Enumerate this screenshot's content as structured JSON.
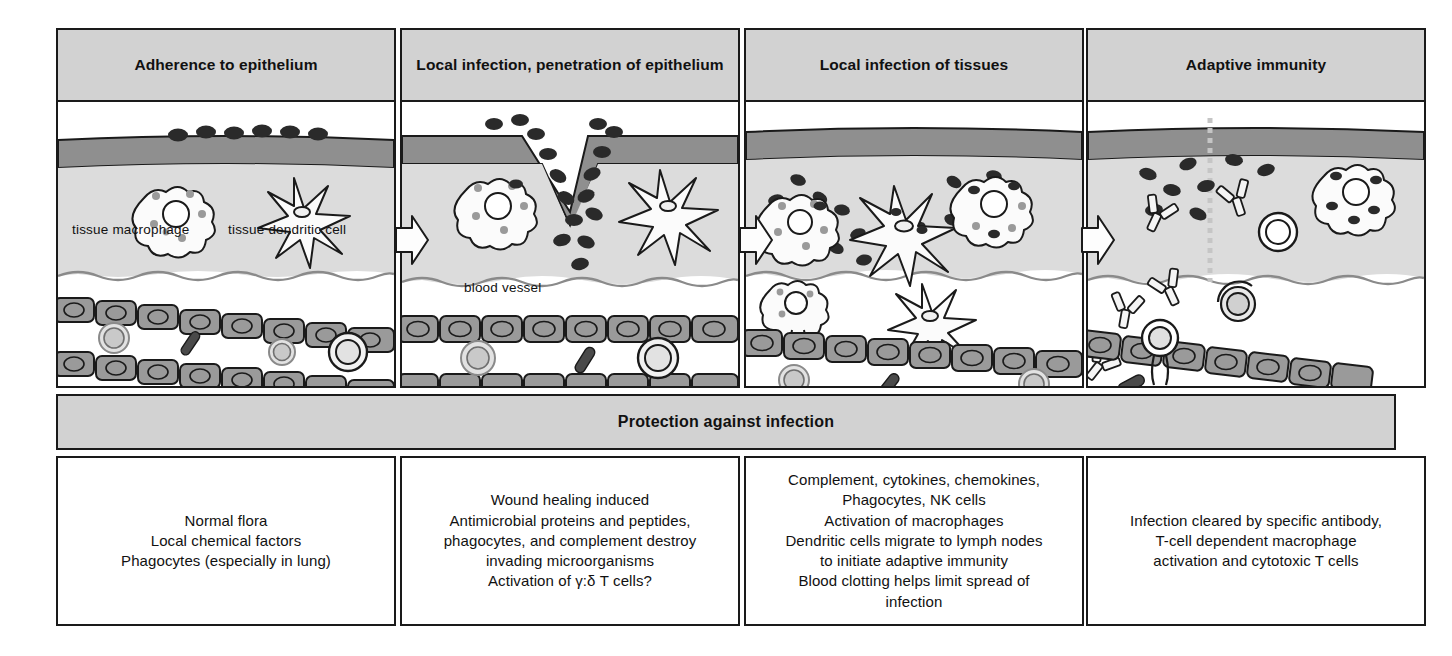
{
  "figure": {
    "banner_label": "Protection against infection",
    "colors": {
      "panel_header_bg": "#d2d2d2",
      "outline": "#1a1a1a",
      "tissue_fill": "#dcdcdc",
      "epithelium_dark": "#8f8f8f",
      "vessel_cell_fill": "#9a9a9a",
      "pathogen_fill": "#2a2a2a",
      "blood_cell_fill": "#c9c9c9"
    }
  },
  "panels": [
    {
      "id": "adherence",
      "title": "Adherence to epithelium",
      "labels": [
        {
          "name": "tissue-macrophage-label",
          "text": "tissue macrophage"
        },
        {
          "name": "tissue-dendritic-cell-label",
          "text": "tissue dendritic cell"
        }
      ]
    },
    {
      "id": "local-infection-penetration",
      "title": "Local infection, penetration of epithelium",
      "title_line1": "Local infection, penetration",
      "title_line2": "of epithelium",
      "labels": [
        {
          "name": "blood-vessel-label",
          "text": "blood vessel"
        }
      ]
    },
    {
      "id": "local-infection-tissues",
      "title": "Local infection of tissues",
      "labels": []
    },
    {
      "id": "adaptive-immunity",
      "title": "Adaptive immunity",
      "labels": []
    }
  ],
  "descriptions": [
    {
      "id": "desc-adherence",
      "lines": [
        "Normal flora",
        "Local chemical factors",
        "Phagocytes (especially in lung)"
      ]
    },
    {
      "id": "desc-penetration",
      "lines": [
        "Wound healing induced",
        "Antimicrobial proteins and peptides,",
        "phagocytes, and complement destroy",
        "invading microorganisms",
        "Activation of γ:δ T cells?"
      ]
    },
    {
      "id": "desc-tissues",
      "lines": [
        "Complement, cytokines, chemokines,",
        "Phagocytes, NK cells",
        "Activation of macrophages",
        "Dendritic cells migrate to lymph nodes",
        "to initiate adaptive immunity",
        "Blood clotting helps limit spread of",
        "infection"
      ]
    },
    {
      "id": "desc-adaptive",
      "lines": [
        "Infection cleared by specific antibody,",
        "T-cell dependent macrophage",
        "activation and cytotoxic T cells"
      ]
    }
  ]
}
